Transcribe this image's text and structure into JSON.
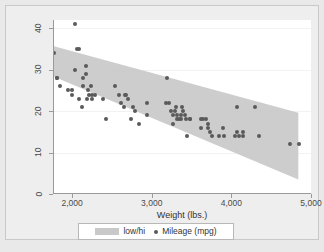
{
  "chart_data": {
    "type": "scatter",
    "title": "",
    "xlabel": "Weight (lbs.)",
    "ylabel": "",
    "xlim": [
      1760,
      5000
    ],
    "ylim": [
      0,
      42
    ],
    "xticks": [
      2000,
      3000,
      4000,
      5000
    ],
    "xticklabels": [
      "2,000",
      "3,000",
      "4,000",
      "5,000"
    ],
    "yticks": [
      0,
      10,
      20,
      30,
      40
    ],
    "yticklabels": [
      "0",
      "10",
      "20",
      "30",
      "40"
    ],
    "grid": "horizontal",
    "legend_position": "bottom",
    "legend": [
      {
        "label": "low/hi",
        "marker": "band",
        "color": "#c9c9c9"
      },
      {
        "label": "Mileage (mpg)",
        "marker": "dot",
        "color": "#5a5a5a"
      }
    ],
    "series": [
      {
        "name": "low/hi",
        "type": "band",
        "color": "#c9c9c9",
        "x": [
          1760,
          4840
        ],
        "hi": [
          35.6,
          19.5
        ],
        "lo": [
          28.2,
          3.3
        ]
      },
      {
        "name": "Mileage (mpg)",
        "type": "scatter",
        "color": "#5a5a5a",
        "points": [
          [
            1800,
            28
          ],
          [
            1800,
            28
          ],
          [
            1760,
            34
          ],
          [
            1830,
            26
          ],
          [
            1930,
            25
          ],
          [
            1990,
            25
          ],
          [
            2020,
            41
          ],
          [
            2050,
            35
          ],
          [
            2070,
            35
          ],
          [
            2020,
            30
          ],
          [
            2160,
            29
          ],
          [
            2160,
            31
          ],
          [
            2130,
            28
          ],
          [
            2120,
            26
          ],
          [
            2190,
            25
          ],
          [
            2200,
            24
          ],
          [
            2230,
            26
          ],
          [
            2240,
            23
          ],
          [
            2170,
            23
          ],
          [
            2070,
            23
          ],
          [
            1980,
            24
          ],
          [
            2110,
            21
          ],
          [
            2240,
            24
          ],
          [
            2280,
            24
          ],
          [
            2370,
            23
          ],
          [
            2410,
            18
          ],
          [
            2520,
            26
          ],
          [
            2580,
            24
          ],
          [
            2600,
            22
          ],
          [
            2640,
            21
          ],
          [
            2650,
            24
          ],
          [
            2670,
            24
          ],
          [
            2690,
            23
          ],
          [
            2730,
            18
          ],
          [
            2750,
            21
          ],
          [
            2780,
            20
          ],
          [
            2830,
            17
          ],
          [
            2930,
            22
          ],
          [
            2930,
            19
          ],
          [
            3180,
            28
          ],
          [
            3170,
            22
          ],
          [
            3210,
            22
          ],
          [
            3230,
            20
          ],
          [
            3250,
            19
          ],
          [
            3260,
            17
          ],
          [
            3280,
            20
          ],
          [
            3290,
            21
          ],
          [
            3300,
            18
          ],
          [
            3310,
            19
          ],
          [
            3330,
            18
          ],
          [
            3350,
            18
          ],
          [
            3360,
            19
          ],
          [
            3370,
            21
          ],
          [
            3380,
            20
          ],
          [
            3400,
            19
          ],
          [
            3420,
            18
          ],
          [
            3430,
            14
          ],
          [
            3470,
            18
          ],
          [
            3470,
            18
          ],
          [
            3600,
            18
          ],
          [
            3610,
            16
          ],
          [
            3630,
            18
          ],
          [
            3670,
            18
          ],
          [
            3690,
            16
          ],
          [
            3700,
            17
          ],
          [
            3720,
            15
          ],
          [
            3740,
            14
          ],
          [
            3830,
            14
          ],
          [
            3880,
            16
          ],
          [
            3900,
            14
          ],
          [
            4030,
            14
          ],
          [
            4060,
            21
          ],
          [
            4060,
            15
          ],
          [
            4080,
            14
          ],
          [
            4130,
            15
          ],
          [
            4130,
            14
          ],
          [
            4290,
            21
          ],
          [
            4330,
            14
          ],
          [
            4720,
            12
          ],
          [
            4840,
            12
          ]
        ]
      }
    ]
  }
}
